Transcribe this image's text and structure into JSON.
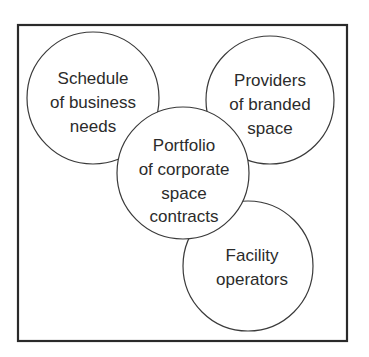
{
  "diagram": {
    "frame": {
      "x": 18,
      "y": 25,
      "width": 329,
      "height": 316
    },
    "colors": {
      "stroke": "#3a3a3a",
      "frame_stroke": "#2a2a2a",
      "text": "#2b2b2b",
      "fill": "#ffffff"
    },
    "nodes": [
      {
        "id": "schedule",
        "cx": 93,
        "cy": 98,
        "r": 66,
        "lines": [
          "Schedule",
          "of business",
          "needs"
        ],
        "line_y": [
          78,
          102,
          126
        ]
      },
      {
        "id": "providers",
        "cx": 270,
        "cy": 100,
        "r": 64,
        "lines": [
          "Providers",
          "of branded",
          "space"
        ],
        "line_y": [
          81,
          105,
          129
        ]
      },
      {
        "id": "facility",
        "cx": 248,
        "cy": 266,
        "r": 65,
        "lines": [
          "Facility",
          "operators"
        ],
        "line_y": [
          256,
          281
        ]
      },
      {
        "id": "portfolio",
        "cx": 183,
        "cy": 173,
        "r": 66,
        "lines": [
          "Portfolio",
          "of corporate",
          "space",
          "contracts"
        ],
        "line_y": [
          146,
          170,
          194,
          218
        ]
      }
    ]
  }
}
